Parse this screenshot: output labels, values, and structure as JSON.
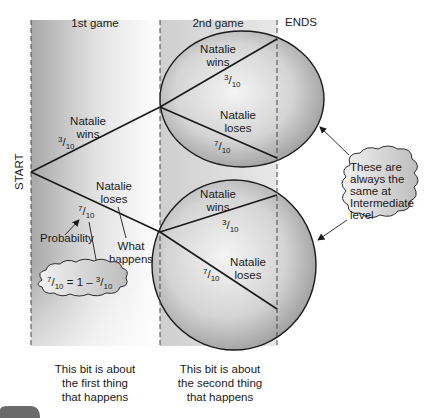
{
  "columns": {
    "first": "1st game",
    "second": "2nd game",
    "ends": "ENDS"
  },
  "start_label": "START",
  "first_game": {
    "wins": {
      "line1": "Natalie",
      "line2": "wins",
      "num": "3",
      "den": "10"
    },
    "loses": {
      "line1": "Natalie",
      "line2": "loses",
      "num": "7",
      "den": "10"
    }
  },
  "second_game_top": {
    "wins": {
      "line1": "Natalie",
      "line2": "wins",
      "num": "3",
      "den": "10"
    },
    "loses": {
      "line1": "Natalie",
      "line2": "loses",
      "num": "7",
      "den": "10"
    }
  },
  "second_game_bottom": {
    "wins": {
      "line1": "Natalie",
      "line2": "wins",
      "num": "3",
      "den": "10"
    },
    "loses": {
      "line1": "Natalie",
      "line2": "loses",
      "num": "7",
      "den": "10"
    }
  },
  "annotations": {
    "probability": "Probability",
    "what_happens_1": "What",
    "what_happens_2": "happens",
    "formula": {
      "lhs_num": "7",
      "lhs_den": "10",
      "mid": " = 1 – ",
      "rhs_num": "3",
      "rhs_den": "10"
    },
    "cloud_lines": [
      "These are",
      "always the",
      "same at",
      "Intermediate",
      "level"
    ]
  },
  "captions": {
    "first": [
      "This bit is about",
      "the first thing",
      "that happens"
    ],
    "second": [
      "This bit is about",
      "the second thing",
      "that happens"
    ]
  },
  "colors": {
    "line": "#1a1a1a",
    "band": "#cfcfcf",
    "ellipse_fill": "#c4c4c4"
  }
}
